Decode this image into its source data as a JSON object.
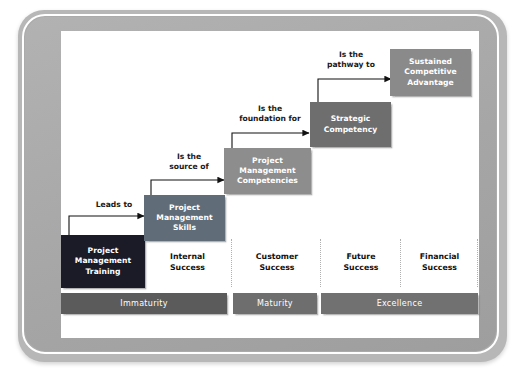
{
  "diagram": {
    "frame": {
      "outer_color": "#b7b7b7",
      "ring_color": "#ababab",
      "canvas_color": "#ffffff"
    },
    "steps": [
      {
        "id": "project-management-training",
        "label": "Project\nManagement\nTraining",
        "color": "#1b1b28",
        "x": 61,
        "y": 235,
        "w": 84,
        "h": 53
      },
      {
        "id": "project-management-skills",
        "label": "Project\nManagement\nSkills",
        "color": "#606d78",
        "x": 144,
        "y": 195,
        "w": 81,
        "h": 46
      },
      {
        "id": "project-management-competencies",
        "label": "Project\nManagement\nCompetencies",
        "color": "#8d8d8d",
        "x": 224,
        "y": 148,
        "w": 87,
        "h": 46
      },
      {
        "id": "strategic-competency",
        "label": "Strategic\nCompetency",
        "color": "#6e6e6e",
        "x": 310,
        "y": 102,
        "w": 81,
        "h": 45
      },
      {
        "id": "sustained-competitive-advantage",
        "label": "Sustained\nCompetitive\nAdvantage",
        "color": "#8a8a8a",
        "x": 390,
        "y": 49,
        "w": 81,
        "h": 47
      }
    ],
    "connectors": [
      {
        "id": "leads-to",
        "label": "Leads to",
        "label_x": 85,
        "label_y": 200,
        "label_w": 56,
        "path_x": 68,
        "path_y": 212,
        "path_w": 78,
        "path_h": 30
      },
      {
        "id": "is-the-source-of",
        "label": "Is the\nsource of",
        "label_x": 157,
        "label_y": 152,
        "label_w": 62,
        "path_x": 150,
        "path_y": 176,
        "path_w": 76,
        "path_h": 27
      },
      {
        "id": "is-the-foundation-for",
        "label": "Is the\nfoundation for",
        "label_x": 228,
        "label_y": 104,
        "label_w": 81,
        "path_x": 232,
        "path_y": 129,
        "path_w": 80,
        "path_h": 28
      },
      {
        "id": "is-the-pathway-to",
        "label": "Is the\npathway to",
        "label_x": 315,
        "label_y": 50,
        "label_w": 70,
        "path_x": 318,
        "path_y": 75,
        "path_w": 74,
        "path_h": 31
      }
    ],
    "success_columns": [
      {
        "id": "internal-success",
        "label": "Internal\nSuccess",
        "x": 145,
        "y": 240,
        "w": 85
      },
      {
        "id": "customer-success",
        "label": "Customer\nSuccess",
        "x": 235,
        "y": 240,
        "w": 85
      },
      {
        "id": "future-success",
        "label": "Future\nSuccess",
        "x": 325,
        "y": 240,
        "w": 75
      },
      {
        "id": "financial-success",
        "label": "Financial\nSuccess",
        "x": 404,
        "y": 240,
        "w": 75
      }
    ],
    "separators": [
      {
        "id": "sep-1",
        "x": 231,
        "y": 239,
        "h": 48
      },
      {
        "id": "sep-2",
        "x": 320,
        "y": 239,
        "h": 48
      },
      {
        "id": "sep-3",
        "x": 400,
        "y": 239,
        "h": 48
      },
      {
        "id": "sep-4",
        "x": 478,
        "y": 239,
        "h": 48
      }
    ],
    "maturity_bars": [
      {
        "id": "immaturity",
        "label": "Immaturity",
        "color": "#5b5b5b",
        "x": 61,
        "y": 293,
        "w": 166,
        "h": 21
      },
      {
        "id": "maturity",
        "label": "Maturity",
        "color": "#6e6e6e",
        "x": 233,
        "y": 293,
        "w": 84,
        "h": 21
      },
      {
        "id": "excellence",
        "label": "Excellence",
        "color": "#717171",
        "x": 321,
        "y": 293,
        "w": 157,
        "h": 21
      }
    ]
  }
}
